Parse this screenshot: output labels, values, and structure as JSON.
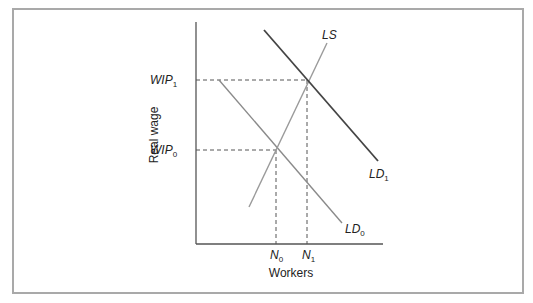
{
  "diagram": {
    "type": "labor-market-supply-demand",
    "x_axis_label": "Workers",
    "y_axis_label": "Real wage",
    "y_ticks": [
      {
        "base": "WIP",
        "sub": "1"
      },
      {
        "base": "WIP",
        "sub": "0"
      }
    ],
    "x_ticks": [
      {
        "base": "N",
        "sub": "0"
      },
      {
        "base": "N",
        "sub": "1"
      }
    ],
    "curves": [
      {
        "base": "LS",
        "sub": "",
        "role": "labor supply"
      },
      {
        "base": "LD",
        "sub": "0",
        "role": "initial labor demand"
      },
      {
        "base": "LD",
        "sub": "1",
        "role": "shifted labor demand"
      }
    ],
    "equilibria": [
      {
        "name": "E0",
        "wage": "WIP0",
        "workers": "N0"
      },
      {
        "name": "E1",
        "wage": "WIP1",
        "workers": "N1"
      }
    ],
    "colors": {
      "frame": "#a9a9a9",
      "axis": "#555555",
      "ls": "#9a9a9a",
      "ld0": "#8a8a8a",
      "ld1": "#444444",
      "dashed": "#555555"
    }
  }
}
